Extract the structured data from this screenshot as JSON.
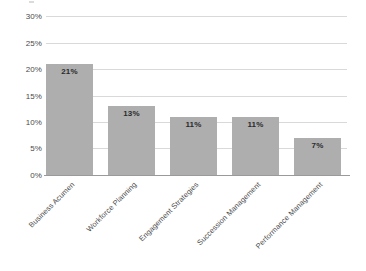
{
  "chart_data": {
    "type": "bar",
    "title": "",
    "xlabel": "",
    "ylabel": "",
    "categories": [
      "Business Acumen",
      "Workforce Planning",
      "Engagement Strategies",
      "Succession Management",
      "Performance Management"
    ],
    "values": [
      21,
      13,
      11,
      11,
      7
    ],
    "value_labels": [
      "21%",
      "13%",
      "11%",
      "11%",
      "7%"
    ],
    "ylim": [
      0,
      30
    ],
    "ytick_values": [
      0,
      5,
      10,
      15,
      20,
      25,
      30
    ],
    "ytick_labels": [
      "0%",
      "5%",
      "10%",
      "15%",
      "20%",
      "25%",
      "30%"
    ],
    "grid": true,
    "legend": "none",
    "bar_color": "#aeaeae",
    "gridline_color": "#d9d9d9",
    "axis_color": "#9a9a9a",
    "label_text_color": "#2b2b2b",
    "background_color": "#ffffff"
  }
}
